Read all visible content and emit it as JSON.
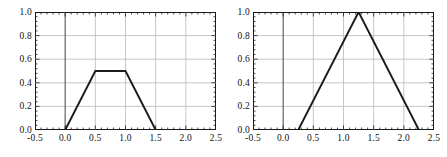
{
  "figure": {
    "background": "#ffffff",
    "line_color": "#1a1a1a",
    "grid_color": "#b8b8b8",
    "axis_color": "#1a1a1a",
    "zero_line_color": "#555555"
  },
  "chart_data": [
    {
      "type": "line",
      "title": "",
      "xlabel": "",
      "ylabel": "",
      "xlim": [
        -0.5,
        2.5
      ],
      "ylim": [
        0.0,
        1.0
      ],
      "grid": true,
      "legend": "none",
      "xticks": [
        -0.5,
        0.0,
        0.5,
        1.0,
        1.5,
        2.0,
        2.5
      ],
      "xticklabels": [
        "-0.5",
        "0.0",
        "0.5",
        "1.0",
        "1.5",
        "2.0",
        "2.5"
      ],
      "yticks": [
        0.0,
        0.2,
        0.4,
        0.6,
        0.8,
        1.0
      ],
      "yticklabels": [
        "0.0",
        "0.2",
        "0.4",
        "0.6",
        "0.8",
        "1.0"
      ],
      "series": [
        {
          "name": "trapezoidal-membership",
          "x": [
            -0.5,
            0.0,
            0.5,
            1.0,
            1.5,
            2.5
          ],
          "values": [
            0.0,
            0.0,
            0.5,
            0.5,
            0.0,
            0.0
          ]
        }
      ]
    },
    {
      "type": "line",
      "title": "",
      "xlabel": "",
      "ylabel": "",
      "xlim": [
        -0.5,
        2.5
      ],
      "ylim": [
        0.0,
        1.0
      ],
      "grid": true,
      "legend": "none",
      "xticks": [
        -0.5,
        0.0,
        0.5,
        1.0,
        1.5,
        2.0,
        2.5
      ],
      "xticklabels": [
        "-0.5",
        "0.0",
        "0.5",
        "1.0",
        "1.5",
        "2.0",
        "2.5"
      ],
      "yticks": [
        0.0,
        0.2,
        0.4,
        0.6,
        0.8,
        1.0
      ],
      "yticklabels": [
        "0.0",
        "0.2",
        "0.4",
        "0.6",
        "0.8",
        "1.0"
      ],
      "series": [
        {
          "name": "triangular-membership",
          "x": [
            -0.5,
            0.25,
            1.25,
            2.25,
            2.5
          ],
          "values": [
            0.0,
            0.0,
            1.0,
            0.0,
            0.0
          ]
        }
      ]
    }
  ]
}
